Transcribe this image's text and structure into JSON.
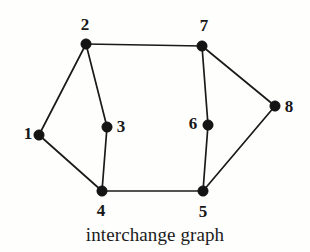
{
  "figure": {
    "caption": "interchange graph",
    "background_color": "#fefefd",
    "ink_color": "#141414"
  },
  "chart_data": {
    "type": "diagram",
    "subtype": "undirected-graph",
    "title": "interchange graph",
    "xlabel": "",
    "ylabel": "",
    "grid": false,
    "legend": null,
    "node_count": 8,
    "edge_count": 10,
    "nodes": [
      {
        "id": "1",
        "label": "1",
        "x": 39,
        "y": 135,
        "label_x": 28,
        "label_y": 133
      },
      {
        "id": "2",
        "label": "2",
        "x": 86,
        "y": 44,
        "label_x": 85,
        "label_y": 24
      },
      {
        "id": "3",
        "label": "3",
        "x": 107,
        "y": 127,
        "label_x": 121,
        "label_y": 126
      },
      {
        "id": "4",
        "label": "4",
        "x": 102,
        "y": 191,
        "label_x": 101,
        "label_y": 210
      },
      {
        "id": "5",
        "label": "5",
        "x": 203,
        "y": 191,
        "label_x": 203,
        "label_y": 211
      },
      {
        "id": "6",
        "label": "6",
        "x": 208,
        "y": 125,
        "label_x": 193,
        "label_y": 123
      },
      {
        "id": "7",
        "label": "7",
        "x": 202,
        "y": 46,
        "label_x": 204,
        "label_y": 25
      },
      {
        "id": "8",
        "label": "8",
        "x": 275,
        "y": 106,
        "label_x": 289,
        "label_y": 106
      }
    ],
    "edges": [
      {
        "source": "1",
        "target": "2"
      },
      {
        "source": "1",
        "target": "4"
      },
      {
        "source": "2",
        "target": "3"
      },
      {
        "source": "2",
        "target": "7"
      },
      {
        "source": "3",
        "target": "4"
      },
      {
        "source": "4",
        "target": "5"
      },
      {
        "source": "5",
        "target": "6"
      },
      {
        "source": "5",
        "target": "8"
      },
      {
        "source": "6",
        "target": "7"
      },
      {
        "source": "7",
        "target": "8"
      }
    ],
    "node_radius": 5.2
  }
}
